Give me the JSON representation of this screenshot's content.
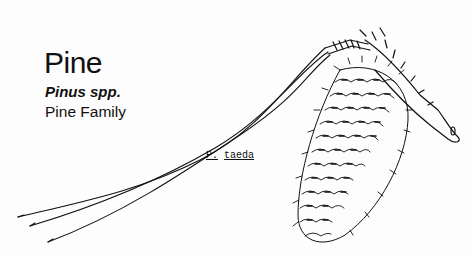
{
  "header": {
    "common_name": "Pine",
    "scientific_name": "Pinus spp.",
    "family": "Pine Family"
  },
  "illustration": {
    "subject": "pine-cone-with-needles",
    "caption_genus": "P.",
    "caption_species": "taeda"
  },
  "colors": {
    "ink": "#111111",
    "background": "#fdfdfd"
  }
}
